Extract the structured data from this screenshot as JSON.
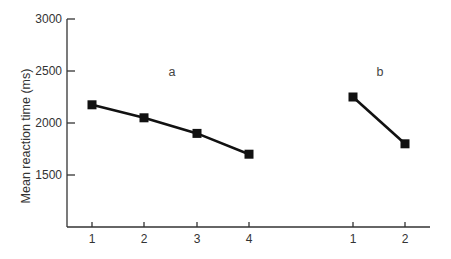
{
  "chart_data": {
    "type": "line",
    "title": "",
    "xlabel": "",
    "ylabel": "Mean reaction time (ms)",
    "ylim": [
      1000,
      3000
    ],
    "yticks": [
      1500,
      2000,
      2500,
      3000
    ],
    "grid": false,
    "legend": null,
    "annotations": [
      "a",
      "b"
    ],
    "series": [
      {
        "name": "a",
        "x": [
          "1",
          "2",
          "3",
          "4"
        ],
        "values": [
          2175,
          2050,
          1900,
          1700
        ]
      },
      {
        "name": "b",
        "x": [
          "1",
          "2"
        ],
        "values": [
          2250,
          1800
        ]
      }
    ],
    "colors": {
      "line": "#111111",
      "marker": "#111111",
      "axis": "#333333"
    }
  },
  "axes": {
    "ylabel": "Mean reaction time (ms)",
    "yticks": [
      "3000",
      "2500",
      "2000",
      "1500"
    ],
    "xticks": [
      "1",
      "2",
      "3",
      "4",
      "1",
      "2"
    ]
  },
  "panels": {
    "a": "a",
    "b": "b"
  }
}
